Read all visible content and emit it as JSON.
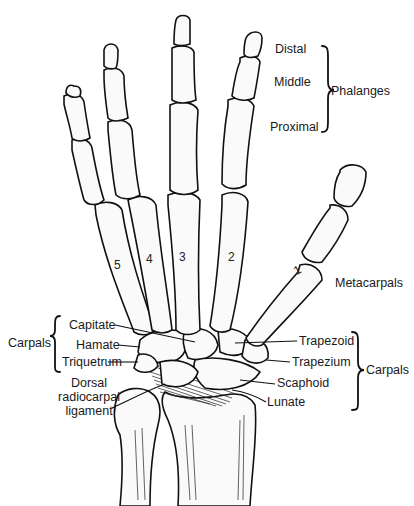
{
  "figure": {
    "digit_numbers": [
      "1",
      "2",
      "3",
      "4",
      "5"
    ]
  },
  "labels": {
    "distal": "Distal",
    "middle": "Middle",
    "proximal": "Proximal",
    "phalanges": "Phalanges",
    "metacarpals": "Metacarpals",
    "carpals_left": "Carpals",
    "capitate": "Capitate",
    "hamate": "Hamate",
    "triquetrum": "Triquetrum",
    "dorsal_line1": "Dorsal",
    "dorsal_line2": "radiocarpal",
    "dorsal_line3": "ligament",
    "trapezoid": "Trapezoid",
    "trapezium": "Trapezium",
    "scaphoid": "Scaphoid",
    "lunate": "Lunate",
    "carpals_right": "Carpals"
  }
}
